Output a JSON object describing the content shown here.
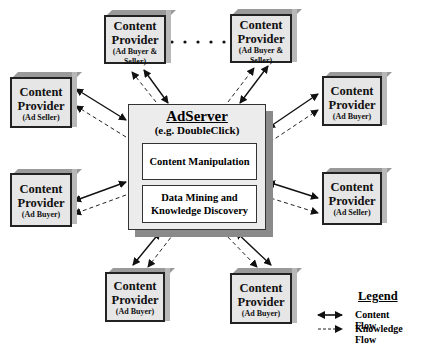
{
  "diagram": {
    "server": {
      "title": "AdServer",
      "subtitle": "(e.g. DoubleClick)",
      "modules": [
        "Content Manipulation",
        "Data Mining and Knowledge Discovery"
      ]
    },
    "providers": [
      {
        "id": "top-left",
        "title": "Content Provider",
        "role": "(Ad Buyer & Seller)"
      },
      {
        "id": "top-right",
        "title": "Content Provider",
        "role": "(Ad Buyer & Seller)"
      },
      {
        "id": "left-upper",
        "title": "Content Provider",
        "role": "(Ad Seller)"
      },
      {
        "id": "right-upper",
        "title": "Content Provider",
        "role": "(Ad Buyer)"
      },
      {
        "id": "left-lower",
        "title": "Content Provider",
        "role": "(Ad Buyer)"
      },
      {
        "id": "right-lower",
        "title": "Content Provider",
        "role": "(Ad Seller)"
      },
      {
        "id": "bottom-left",
        "title": "Content Provider",
        "role": "(Ad Buyer)"
      },
      {
        "id": "bottom-right",
        "title": "Content Provider",
        "role": "(Ad Buyer)"
      }
    ],
    "ellipsis": ". . . .",
    "legend": {
      "title": "Legend",
      "items": [
        {
          "style": "solid-double-arrow",
          "label": "Content Flow"
        },
        {
          "style": "dashed-arrow",
          "label": "Knowledge Flow"
        }
      ]
    }
  }
}
